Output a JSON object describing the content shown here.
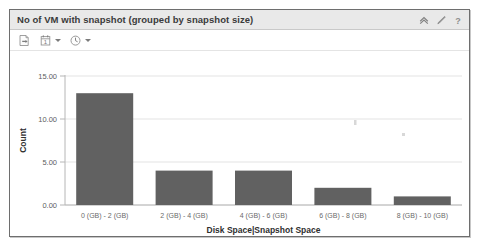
{
  "panel": {
    "title": "No of VM with snapshot (grouped by snapshot size)",
    "header_icons": [
      {
        "name": "collapse-icon",
        "glyph": "chevron-up"
      },
      {
        "name": "edit-icon",
        "glyph": "pencil"
      },
      {
        "name": "help-icon",
        "glyph": "question-mark"
      }
    ],
    "toolbar": [
      {
        "name": "export-button",
        "glyph": "page-export",
        "has_menu": false
      },
      {
        "name": "date-range-button",
        "glyph": "calendar",
        "has_menu": true
      },
      {
        "name": "time-range-button",
        "glyph": "clock",
        "has_menu": true
      }
    ]
  },
  "colors": {
    "bar_fill": "#616161",
    "panel_border": "#6e6e6e",
    "header_bg": "#e9e9e9",
    "gridline": "#e3e3e3",
    "axis": "#b6b6b6"
  },
  "chart_data": {
    "type": "bar",
    "title": "No of VM with snapshot (grouped by snapshot size)",
    "xlabel": "Disk Space|Snapshot Space",
    "ylabel": "Count",
    "categories": [
      "0 (GB) - 2 (GB)",
      "2 (GB) - 4 (GB)",
      "4 (GB) - 6 (GB)",
      "6 (GB) - 8 (GB)",
      "8 (GB) - 10 (GB)"
    ],
    "values": [
      13,
      4,
      4,
      2,
      1
    ],
    "ylim": [
      0,
      15
    ],
    "yticks": [
      0,
      5,
      10,
      15
    ],
    "ytick_labels": [
      "0.00",
      "5.00",
      "10.00",
      "15.00"
    ],
    "grid": true,
    "legend": false
  }
}
